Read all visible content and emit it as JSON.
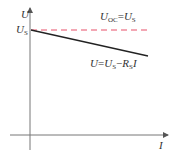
{
  "diagram": {
    "axes": {
      "y_label": "U",
      "x_label": "I"
    },
    "y_intercept_label": {
      "main": "U",
      "sub": "S"
    },
    "open_circuit_line": {
      "label": {
        "a": "U",
        "a_sub": "OC",
        "eq": "=",
        "b": "U",
        "b_sub": "S"
      },
      "color": "#e8506a",
      "style": "dashed"
    },
    "load_line": {
      "label": {
        "a": "U",
        "eq1": "=",
        "b": "U",
        "b_sub": "S",
        "minus": "−",
        "c": "R",
        "c_sub": "S",
        "d": "I"
      },
      "color": "#222222",
      "style": "solid"
    }
  }
}
